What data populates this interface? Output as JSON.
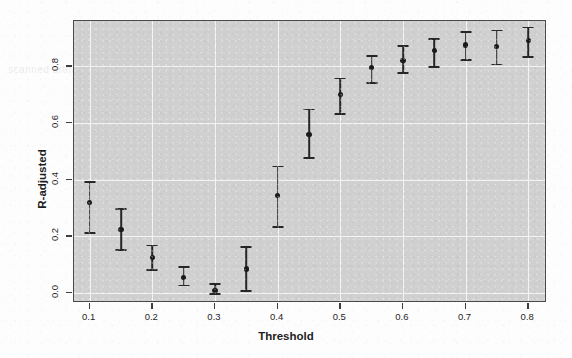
{
  "chart_data": {
    "type": "scatter",
    "title": "",
    "xlabel": "Threshold",
    "ylabel": "R-adjusted",
    "xlim": [
      0.075,
      0.83
    ],
    "ylim": [
      -0.035,
      0.96
    ],
    "grid": true,
    "legend": null,
    "x_ticks": [
      "0.1",
      "0.2",
      "0.3",
      "0.4",
      "0.5",
      "0.6",
      "0.7",
      "0.8"
    ],
    "x_tick_values": [
      0.1,
      0.2,
      0.3,
      0.4,
      0.5,
      0.6,
      0.7,
      0.8
    ],
    "y_ticks": [
      "0.0",
      "0.2",
      "0.4",
      "0.6",
      "0.8"
    ],
    "y_tick_values": [
      0.0,
      0.2,
      0.4,
      0.6,
      0.8
    ],
    "marker": "filled-circle",
    "error_bars": "vertical-with-caps",
    "x": [
      0.1,
      0.15,
      0.2,
      0.25,
      0.3,
      0.35,
      0.4,
      0.45,
      0.5,
      0.55,
      0.6,
      0.65,
      0.7,
      0.75,
      0.8
    ],
    "values": [
      0.32,
      0.225,
      0.125,
      0.055,
      0.01,
      0.085,
      0.345,
      0.56,
      0.7,
      0.795,
      0.82,
      0.855,
      0.875,
      0.87,
      0.89
    ],
    "y_lower": [
      0.215,
      0.155,
      0.085,
      0.03,
      0.0,
      0.01,
      0.235,
      0.48,
      0.635,
      0.745,
      0.78,
      0.8,
      0.825,
      0.81,
      0.835
    ],
    "y_upper": [
      0.395,
      0.3,
      0.17,
      0.095,
      0.035,
      0.165,
      0.45,
      0.65,
      0.76,
      0.84,
      0.875,
      0.9,
      0.925,
      0.93,
      0.94
    ],
    "points": [
      {
        "x": 0.1,
        "y": 0.32,
        "lo": 0.215,
        "hi": 0.395
      },
      {
        "x": 0.15,
        "y": 0.225,
        "lo": 0.155,
        "hi": 0.3
      },
      {
        "x": 0.2,
        "y": 0.125,
        "lo": 0.085,
        "hi": 0.17
      },
      {
        "x": 0.25,
        "y": 0.055,
        "lo": 0.03,
        "hi": 0.095
      },
      {
        "x": 0.3,
        "y": 0.01,
        "lo": 0.0,
        "hi": 0.035
      },
      {
        "x": 0.35,
        "y": 0.085,
        "lo": 0.01,
        "hi": 0.165
      },
      {
        "x": 0.4,
        "y": 0.345,
        "lo": 0.235,
        "hi": 0.45
      },
      {
        "x": 0.45,
        "y": 0.56,
        "lo": 0.48,
        "hi": 0.65
      },
      {
        "x": 0.5,
        "y": 0.7,
        "lo": 0.635,
        "hi": 0.76
      },
      {
        "x": 0.55,
        "y": 0.795,
        "lo": 0.745,
        "hi": 0.84
      },
      {
        "x": 0.6,
        "y": 0.82,
        "lo": 0.78,
        "hi": 0.875
      },
      {
        "x": 0.65,
        "y": 0.855,
        "lo": 0.8,
        "hi": 0.9
      },
      {
        "x": 0.7,
        "y": 0.875,
        "lo": 0.825,
        "hi": 0.925
      },
      {
        "x": 0.75,
        "y": 0.87,
        "lo": 0.81,
        "hi": 0.93
      },
      {
        "x": 0.8,
        "y": 0.89,
        "lo": 0.835,
        "hi": 0.94
      }
    ]
  },
  "style": {
    "panel_background": "#d0d0d0",
    "grid_color": "#f4f4f4",
    "marker_color": "#1a1a1a",
    "error_bar_color": "#262626",
    "axis_color": "#3d3d3d",
    "page_background": "#fdfdfd"
  },
  "ghost_text": {
    "a": "scanned artifact",
    "b": "bleed through",
    "c": "reverse page"
  }
}
